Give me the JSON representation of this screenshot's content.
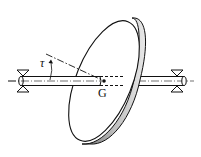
{
  "diagram": {
    "labels": {
      "angle": "τ",
      "center": "G"
    },
    "colors": {
      "stroke": "#111111",
      "rim_dark": "#555555",
      "rim_light": "#cccccc",
      "background": "#ffffff"
    }
  }
}
